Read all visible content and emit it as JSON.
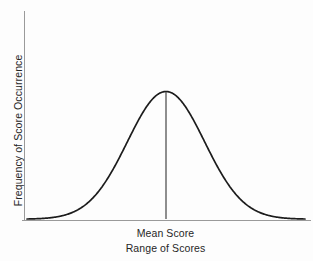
{
  "figure": {
    "background_color": "#fdfdfd"
  },
  "axes": {
    "y_axis_label": "Frequency of Score Occurrence",
    "x_axis_label": "Range of Scores",
    "axis_color": "#9a9a9a"
  },
  "annotations": {
    "mean_label": "Mean Score",
    "mean_line_color": "#8e8e8e"
  },
  "curve": {
    "color": "#1c1c1c",
    "stroke_width": 1.7
  },
  "chart_data": {
    "type": "line",
    "xlabel": "Range of Scores",
    "ylabel": "Frequency of Score Occurrence",
    "grid": false,
    "legend": "none",
    "xlim": [
      -3.6,
      3.6
    ],
    "ylim": [
      0,
      1
    ],
    "xticks": [],
    "yticks": [],
    "annotations": [
      {
        "text": "Mean Score",
        "x": 0,
        "y": 0,
        "type": "vertical-line-label"
      }
    ],
    "series": [
      {
        "name": "Frequency of Score Occurrence",
        "distribution": "normal",
        "mean": 0,
        "sigma": 1,
        "x": [
          -3.6,
          -3.2,
          -2.8,
          -2.4,
          -2.0,
          -1.6,
          -1.2,
          -0.8,
          -0.4,
          0.0,
          0.4,
          0.8,
          1.2,
          1.6,
          2.0,
          2.4,
          2.8,
          3.2,
          3.6
        ],
        "values": [
          0.0015,
          0.006,
          0.0198,
          0.0561,
          0.1353,
          0.278,
          0.4868,
          0.7261,
          0.9231,
          1.0,
          0.9231,
          0.7261,
          0.4868,
          0.278,
          0.1353,
          0.0561,
          0.0198,
          0.006,
          0.0015
        ]
      }
    ]
  }
}
